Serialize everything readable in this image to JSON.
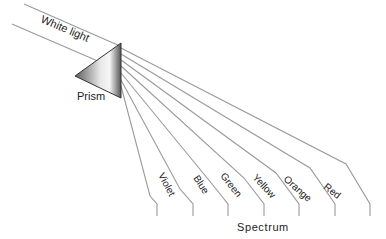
{
  "diagram": {
    "incoming_label": "White light",
    "prism_label": "Prism",
    "spectrum_label": "Spectrum",
    "colors": [
      {
        "name": "Violet"
      },
      {
        "name": "Blue"
      },
      {
        "name": "Green"
      },
      {
        "name": "Yellow"
      },
      {
        "name": "Orange"
      },
      {
        "name": "Red"
      }
    ],
    "line_color": "#9a9a9a",
    "prism_gradient": [
      "#6e6e6e",
      "#f2f2f2",
      "#5a5a5a"
    ]
  }
}
